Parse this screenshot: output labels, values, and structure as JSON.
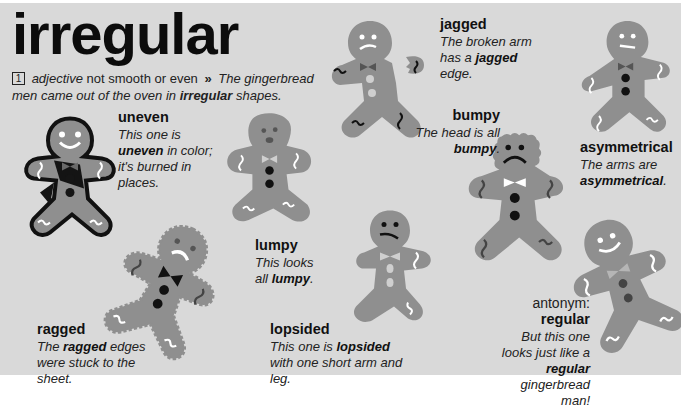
{
  "entry": {
    "headword": "irregular",
    "sense_number": "1",
    "part_of_speech": "adjective",
    "definition": "not smooth or even",
    "arrow": "»",
    "example_before": "The gingerbread men came out of the oven in ",
    "example_bold": "irregular",
    "example_after": " shapes."
  },
  "colors": {
    "background": "#d9d9d9",
    "cookie": "#8f8f8f",
    "icing": "#ffffff",
    "text": "#111111"
  },
  "labels": {
    "uneven": {
      "head": "uneven",
      "pre": "",
      "bold": "uneven",
      "post": " in color; it's burned in places.",
      "lead": "This one is "
    },
    "jagged": {
      "head": "jagged",
      "lead": "The broken arm has a ",
      "bold": "jagged",
      "post": " edge."
    },
    "bumpy": {
      "head": "bumpy",
      "lead": "The head is all ",
      "bold": "bumpy",
      "post": "."
    },
    "asymmetrical": {
      "head": "asymmetrical",
      "lead": "The arms are ",
      "bold": "asymmetrical",
      "post": "."
    },
    "lumpy": {
      "head": "lumpy",
      "lead": "This looks all ",
      "bold": "lumpy",
      "post": "."
    },
    "ragged": {
      "head": "ragged",
      "lead": "The ",
      "bold": "ragged",
      "post": " edges were stuck to the sheet."
    },
    "lopsided": {
      "head": "lopsided",
      "lead": "This one is ",
      "bold": "lopsided",
      "post": " with one short arm and leg."
    },
    "regular": {
      "antonym_label": "antonym:",
      "head": "regular",
      "lead": "But this one looks just like a ",
      "bold": "regular",
      "post": " gingerbread man!"
    }
  },
  "illustrations": [
    "burned-gingerbread-man",
    "ragged-gingerbread-man",
    "lumpy-gingerbread-man",
    "broken-arm-gingerbread-man",
    "lopsided-gingerbread-man",
    "bumpy-head-gingerbread-man",
    "asymmetrical-gingerbread-man",
    "regular-gingerbread-man"
  ]
}
